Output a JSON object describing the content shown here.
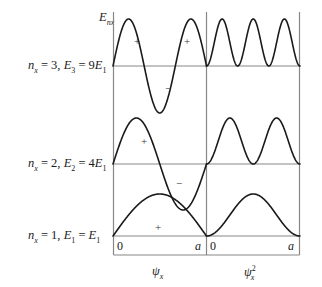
{
  "figure": {
    "title": "",
    "frame": {
      "left": 113,
      "right": 300,
      "top": 12,
      "bottom": 255,
      "divider": 206.5
    },
    "energy_axis_label": "E",
    "energy_axis_sub": "nx",
    "rows": [
      {
        "id": "n3",
        "label_n": "n",
        "label_n_sub": "x",
        "label_text": " = 3, ",
        "label_E": "E",
        "label_E_sub": "3",
        "label_eq": " = 9",
        "label_E1": "E",
        "label_E1_sub": "1",
        "full_label": "n_x = 3, E_3 = 9E_1",
        "baseline_y": 66,
        "quantum_number": 3,
        "energy": "9E1",
        "signs": [
          {
            "glyph": "+",
            "x": 136,
            "y": 40
          },
          {
            "glyph": "−",
            "x": 168,
            "y": 85
          },
          {
            "glyph": "+",
            "x": 186,
            "y": 40
          }
        ]
      },
      {
        "id": "n2",
        "label_n": "n",
        "label_n_sub": "x",
        "label_text": " = 2, ",
        "label_E": "E",
        "label_E_sub": "2",
        "label_eq": " = 4",
        "label_E1": "E",
        "label_E1_sub": "1",
        "full_label": "n_x = 2, E_2 = 4E_1",
        "baseline_y": 164,
        "quantum_number": 2,
        "energy": "4E1",
        "signs": [
          {
            "glyph": "+",
            "x": 143,
            "y": 140
          },
          {
            "glyph": "−",
            "x": 178,
            "y": 180
          }
        ]
      },
      {
        "id": "n1",
        "label_n": "n",
        "label_n_sub": "x",
        "label_text": " = 1, ",
        "label_E": "E",
        "label_E_sub": "1",
        "label_eq": " = ",
        "label_E1": "E",
        "label_E1_sub": "1",
        "full_label": "n_x = 1, E_1 = E_1",
        "baseline_y": 236,
        "quantum_number": 1,
        "energy": "E1",
        "signs": [
          {
            "glyph": "+",
            "x": 157,
            "y": 226
          }
        ]
      }
    ],
    "ticks": {
      "left_panel_start": "0",
      "left_panel_end": "a",
      "right_panel_start": "0",
      "right_panel_end": "a"
    },
    "axis_names": {
      "left": "ψ",
      "left_sub": "x",
      "right": "ψ",
      "right_sub": "x",
      "right_sup": "2"
    },
    "colors": {
      "curve": "#1a1a1a",
      "frame": "#808080",
      "baseline": "#808080",
      "text": "#1a1a1a",
      "background": "#ffffff"
    }
  },
  "chart_data": {
    "type": "line",
    "xlabel": "x",
    "ylabel": "E_nx",
    "xlim": [
      0,
      1
    ],
    "grid": false,
    "legend": "none",
    "panels": [
      {
        "name": "psi_x",
        "label": "ψx",
        "x_ticks": [
          "0",
          "a"
        ]
      },
      {
        "name": "psi_x_squared",
        "label": "ψx²",
        "x_ticks": [
          "0",
          "a"
        ]
      }
    ],
    "series": [
      {
        "name": "n_x = 1",
        "energy_label": "E_1 = E_1",
        "baseline_level": 1,
        "nodes": 0,
        "psi": "sin(1*pi*x/a)",
        "psi_squared": "sin^2(1*pi*x/a)",
        "lobe_signs": [
          "+"
        ]
      },
      {
        "name": "n_x = 2",
        "energy_label": "E_2 = 4E_1",
        "baseline_level": 2,
        "nodes": 1,
        "psi": "sin(2*pi*x/a)",
        "psi_squared": "sin^2(2*pi*x/a)",
        "lobe_signs": [
          "+",
          "−"
        ]
      },
      {
        "name": "n_x = 3",
        "energy_label": "E_3 = 9E_1",
        "baseline_level": 3,
        "nodes": 2,
        "psi": "sin(3*pi*x/a)",
        "psi_squared": "sin^2(3*pi*x/a)",
        "lobe_signs": [
          "+",
          "−",
          "+"
        ]
      }
    ]
  }
}
